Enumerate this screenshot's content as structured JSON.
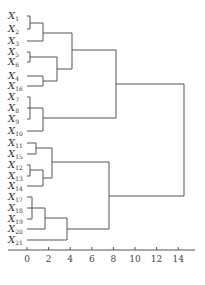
{
  "chart_data": {
    "type": "dendrogram",
    "title": "",
    "xlabel": "",
    "ylabel": "",
    "orientation": "horizontal",
    "xlim": [
      -2,
      15.5
    ],
    "x_ticks": [
      0,
      2,
      4,
      6,
      8,
      10,
      12,
      14
    ],
    "grid": false,
    "leaves": [
      {
        "id": "X1",
        "y": 16
      },
      {
        "id": "X2",
        "y": 29
      },
      {
        "id": "X3",
        "y": 41
      },
      {
        "id": "X5",
        "y": 52
      },
      {
        "id": "X6",
        "y": 62
      },
      {
        "id": "X4",
        "y": 76
      },
      {
        "id": "X16",
        "y": 86
      },
      {
        "id": "X7",
        "y": 97
      },
      {
        "id": "X8",
        "y": 108
      },
      {
        "id": "X9",
        "y": 119
      },
      {
        "id": "X10",
        "y": 131
      },
      {
        "id": "X11",
        "y": 143
      },
      {
        "id": "X15",
        "y": 154
      },
      {
        "id": "X12",
        "y": 165
      },
      {
        "id": "X13",
        "y": 176
      },
      {
        "id": "X14",
        "y": 186
      },
      {
        "id": "X17",
        "y": 197
      },
      {
        "id": "X18",
        "y": 208
      },
      {
        "id": "X19",
        "y": 219
      },
      {
        "id": "X20",
        "y": 229
      },
      {
        "id": "X21",
        "y": 240
      }
    ],
    "merges": [
      {
        "children": [
          "X1",
          "X2"
        ],
        "height": 0.3
      },
      {
        "children": [
          "X1,X2",
          "X3"
        ],
        "height": 1.5
      },
      {
        "children": [
          "X5",
          "X6"
        ],
        "height": 0.3
      },
      {
        "children": [
          "X4",
          "X16"
        ],
        "height": 1.5
      },
      {
        "children": [
          "X5,X6",
          "X4,X16"
        ],
        "height": 2.8
      },
      {
        "children": [
          "X1-X3",
          "X5,X6,X4,X16"
        ],
        "height": 4.2
      },
      {
        "children": [
          "X7",
          "X8",
          "X9"
        ],
        "height": 0.3
      },
      {
        "children": [
          "X7-X9",
          "X10"
        ],
        "height": 1.5
      },
      {
        "children": [
          "X1-X16 group",
          "X7-X10"
        ],
        "height": 8.2
      },
      {
        "children": [
          "X11",
          "X15"
        ],
        "height": 0.8
      },
      {
        "children": [
          "X12",
          "X13"
        ],
        "height": 0.3
      },
      {
        "children": [
          "X12,X13",
          "X14"
        ],
        "height": 1.5
      },
      {
        "children": [
          "X11,X15",
          "X12-X14"
        ],
        "height": 2.3
      },
      {
        "children": [
          "X17",
          "X18",
          "X19"
        ],
        "height": 0.5
      },
      {
        "children": [
          "X17-X19",
          "X20"
        ],
        "height": 1.7
      },
      {
        "children": [
          "X17-X20",
          "X21"
        ],
        "height": 3.7
      },
      {
        "children": [
          "X11-X14 group",
          "X17-X21"
        ],
        "height": 7.6
      },
      {
        "children": [
          "top",
          "bottom"
        ],
        "height": 14.5
      }
    ]
  },
  "segments": [
    "M27 16 H30 V29 H27",
    "M30 23 H43 V41 H27",
    "M27 52 H30 V62 H27",
    "M27 76 H43 V86 H27",
    "M30 57 H57 V81 H43",
    "M43 33 H72 V69 H57",
    "M27 97 H30 V119 H27",
    "M27 108 H30",
    "M30 108 H43 V131 H27",
    "M72 50 H116 V118 H43",
    "M27 143 H36 V154 H27",
    "M27 165 H30 V176 H27",
    "M30 170 H43 V186 H27",
    "M36 148 H52 V178 H43",
    "M27 197 H32 V219 H27",
    "M27 208 H32",
    "M32 208 H45 V229 H27",
    "M45 218 H67 V240 H27",
    "M52 162 H109 V229 H67",
    "M116 84 H184 V196 H109"
  ],
  "axis": {
    "y": 250,
    "x0": 8,
    "x1": 195,
    "origin_px": 27,
    "px_per_unit": 10.8
  },
  "caption": ""
}
